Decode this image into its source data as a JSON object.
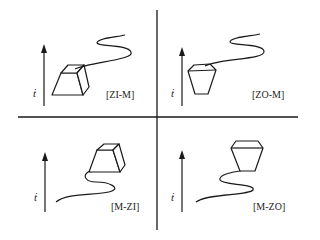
{
  "diagram": {
    "type": "four-quadrant schematic",
    "colors": {
      "stroke": "#1a1a1a",
      "background": "#ffffff"
    },
    "axis_label": "ṫ",
    "quadrants": [
      {
        "id": "top-left",
        "label": "[ZI-M]",
        "shape": "frustum-narrow-top",
        "trajectory": "from shape upward (shape at start)"
      },
      {
        "id": "top-right",
        "label": "[ZO-M]",
        "shape": "frustum-wide-top",
        "trajectory": "from shape upward (shape at start)"
      },
      {
        "id": "bottom-left",
        "label": "[M-ZI]",
        "shape": "frustum-narrow-top",
        "trajectory": "upward into shape (shape at end)"
      },
      {
        "id": "bottom-right",
        "label": "[M-ZO]",
        "shape": "frustum-wide-top",
        "trajectory": "upward into shape (shape at end)"
      }
    ]
  }
}
